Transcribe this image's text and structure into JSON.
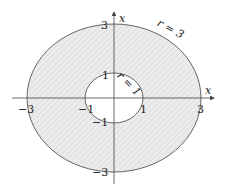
{
  "diagram": {
    "outer_circle": {
      "label": "r = 3",
      "radius": 3
    },
    "inner_circle": {
      "label": "r = 1",
      "radius": 1
    },
    "axes": {
      "horizontal_label": "x",
      "vertical_label": "x"
    },
    "ticks": {
      "x_neg3": "−3",
      "x_neg1": "−1",
      "x_pos1": "1",
      "x_pos3": "3",
      "y_pos3": "3",
      "y_pos1": "1",
      "y_neg1": "−1",
      "y_neg3": "−3"
    },
    "colors": {
      "fill": "#ebebeb",
      "hatch": "#c8c8c8",
      "stroke": "#555555",
      "axis": "#444444"
    }
  }
}
